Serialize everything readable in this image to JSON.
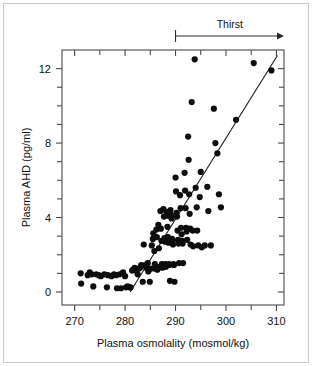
{
  "figure": {
    "width": 312,
    "height": 366,
    "background": "#ffffff",
    "border_color": "#c9c9c9"
  },
  "annotations": [
    {
      "name": "thirst-annotation",
      "label": "Thirst",
      "x_start": 290,
      "x_end": 311.5,
      "style": "arrow-right-with-left-tick"
    }
  ],
  "chart_data": {
    "type": "scatter",
    "title": "",
    "subtitle": "",
    "xlabel": "Plasma osmolality (mosmol/kg)",
    "ylabel": "Plasma AHD (pg/ml)",
    "xlim": [
      267.5,
      311.5
    ],
    "ylim": [
      -0.7,
      13.0
    ],
    "grid": false,
    "legend": null,
    "legend_position": "none",
    "x_ticks_major": [
      270,
      280,
      290,
      300,
      310
    ],
    "x_ticks_minor": [
      275,
      285,
      295,
      305
    ],
    "x_tick_labels": [
      "270",
      "280",
      "290",
      "300",
      "310"
    ],
    "y_ticks_major": [
      0,
      4,
      8,
      12
    ],
    "y_ticks_minor": [
      1,
      2,
      3,
      5,
      6,
      7,
      9,
      10,
      11
    ],
    "y_tick_labels": [
      "0",
      "4",
      "8",
      "12"
    ],
    "marker": {
      "shape": "circle",
      "color": "#0d0d0d",
      "size_px": 3.1
    },
    "series": [
      {
        "name": "Plasma AHD vs plasma osmolality",
        "points": [
          [
            271.2,
            1.0
          ],
          [
            271.3,
            0.45
          ],
          [
            272.6,
            0.9
          ],
          [
            273.0,
            1.05
          ],
          [
            273.4,
            0.95
          ],
          [
            273.7,
            0.3
          ],
          [
            274.3,
            0.95
          ],
          [
            274.8,
            0.9
          ],
          [
            275.2,
            0.85
          ],
          [
            275.9,
            0.95
          ],
          [
            276.4,
            0.25
          ],
          [
            276.6,
            0.9
          ],
          [
            277.3,
            0.85
          ],
          [
            277.8,
            0.95
          ],
          [
            278.2,
            0.9
          ],
          [
            278.4,
            0.2
          ],
          [
            278.9,
            0.95
          ],
          [
            279.2,
            0.2
          ],
          [
            279.6,
            1.05
          ],
          [
            280.0,
            0.85
          ],
          [
            280.2,
            0.25
          ],
          [
            280.5,
            0.3
          ],
          [
            280.9,
            0.25
          ],
          [
            281.1,
            0.25
          ],
          [
            281.4,
            1.15
          ],
          [
            281.6,
            1.2
          ],
          [
            281.9,
            1.3
          ],
          [
            282.2,
            1.15
          ],
          [
            282.5,
            0.95
          ],
          [
            282.7,
            1.25
          ],
          [
            283.0,
            1.3
          ],
          [
            283.2,
            1.45
          ],
          [
            283.5,
            0.55
          ],
          [
            283.7,
            2.55
          ],
          [
            284.0,
            1.45
          ],
          [
            284.2,
            1.3
          ],
          [
            284.5,
            1.55
          ],
          [
            284.6,
            1.1
          ],
          [
            284.9,
            0.55
          ],
          [
            285.1,
            1.25
          ],
          [
            285.3,
            2.5
          ],
          [
            285.5,
            2.85
          ],
          [
            285.6,
            3.15
          ],
          [
            285.8,
            2.2
          ],
          [
            285.9,
            1.5
          ],
          [
            286.0,
            1.25
          ],
          [
            286.2,
            3.35
          ],
          [
            286.3,
            2.95
          ],
          [
            286.4,
            1.2
          ],
          [
            286.6,
            3.6
          ],
          [
            286.7,
            2.35
          ],
          [
            286.8,
            1.35
          ],
          [
            287.0,
            4.35
          ],
          [
            287.1,
            3.4
          ],
          [
            287.2,
            2.75
          ],
          [
            287.3,
            1.5
          ],
          [
            287.4,
            1.3
          ],
          [
            287.6,
            4.45
          ],
          [
            287.7,
            4.05
          ],
          [
            287.8,
            2.9
          ],
          [
            287.9,
            2.7
          ],
          [
            288.0,
            1.5
          ],
          [
            288.1,
            1.35
          ],
          [
            288.2,
            4.3
          ],
          [
            288.3,
            4.1
          ],
          [
            288.4,
            3.5
          ],
          [
            288.5,
            2.95
          ],
          [
            288.6,
            2.65
          ],
          [
            288.7,
            1.5
          ],
          [
            288.8,
            1.45
          ],
          [
            288.9,
            0.6
          ],
          [
            289.0,
            4.4
          ],
          [
            289.1,
            4.15
          ],
          [
            289.2,
            3.95
          ],
          [
            289.3,
            2.85
          ],
          [
            289.4,
            2.7
          ],
          [
            289.5,
            2.55
          ],
          [
            289.6,
            1.5
          ],
          [
            289.7,
            1.45
          ],
          [
            289.8,
            0.55
          ],
          [
            290.0,
            6.15
          ],
          [
            290.1,
            5.4
          ],
          [
            290.2,
            4.25
          ],
          [
            290.3,
            4.05
          ],
          [
            290.4,
            3.3
          ],
          [
            290.5,
            2.8
          ],
          [
            290.6,
            2.6
          ],
          [
            290.7,
            1.55
          ],
          [
            290.9,
            5.2
          ],
          [
            291.0,
            4.5
          ],
          [
            291.1,
            3.45
          ],
          [
            291.2,
            3.1
          ],
          [
            291.3,
            2.75
          ],
          [
            291.4,
            2.6
          ],
          [
            291.5,
            1.55
          ],
          [
            291.8,
            6.4
          ],
          [
            291.9,
            5.45
          ],
          [
            292.0,
            4.5
          ],
          [
            292.1,
            3.45
          ],
          [
            292.2,
            3.25
          ],
          [
            292.3,
            2.8
          ],
          [
            292.5,
            8.35
          ],
          [
            292.6,
            7.1
          ],
          [
            292.7,
            5.25
          ],
          [
            292.8,
            4.2
          ],
          [
            292.9,
            3.4
          ],
          [
            293.0,
            2.55
          ],
          [
            293.2,
            10.2
          ],
          [
            293.4,
            3.3
          ],
          [
            293.5,
            2.45
          ],
          [
            293.8,
            12.5
          ],
          [
            294.0,
            5.6
          ],
          [
            294.2,
            4.55
          ],
          [
            294.3,
            3.3
          ],
          [
            294.5,
            2.5
          ],
          [
            294.8,
            5.1
          ],
          [
            295.0,
            6.45
          ],
          [
            295.2,
            2.4
          ],
          [
            295.8,
            2.5
          ],
          [
            296.3,
            5.65
          ],
          [
            296.5,
            4.35
          ],
          [
            297.0,
            2.5
          ],
          [
            297.6,
            9.85
          ],
          [
            297.9,
            8.0
          ],
          [
            298.3,
            7.45
          ],
          [
            298.6,
            5.25
          ],
          [
            299.0,
            4.55
          ],
          [
            302.0,
            9.25
          ],
          [
            305.5,
            12.3
          ],
          [
            309.0,
            11.9
          ]
        ]
      }
    ],
    "trend_line": {
      "name": "regression-line",
      "x_start": 281.0,
      "y_start": 0.0,
      "x_end": 310.2,
      "y_end": 12.7,
      "color": "#1a1a1a"
    }
  }
}
